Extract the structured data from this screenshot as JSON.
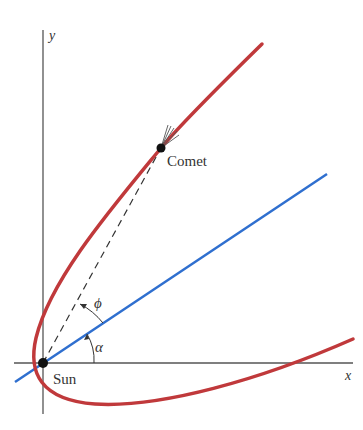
{
  "diagram": {
    "axes": {
      "x_label": "x",
      "y_label": "y"
    },
    "labels": {
      "comet": "Comet",
      "sun": "Sun",
      "phi": "ϕ",
      "alpha": "α"
    },
    "colors": {
      "orbit": "#c0393b",
      "axis_of_symmetry": "#2f6fcf",
      "coordinate_axes": "#555555",
      "points": "#111111",
      "dashed_line": "#333333"
    }
  }
}
